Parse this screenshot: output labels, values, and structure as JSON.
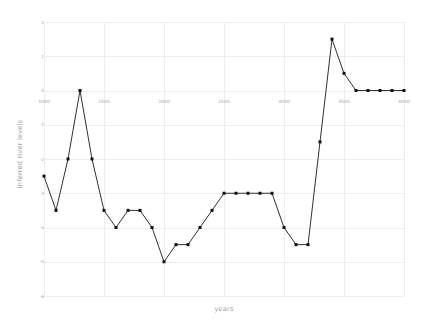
{
  "chart": {
    "title": "",
    "xlabel": "years",
    "ylabel": "inferred river levels",
    "background_color": "#ffffff",
    "line_color": "#1a1a1a",
    "marker_color": "#111111",
    "grid_color": "#eceef0",
    "tick_label_color": "#9aa0a6"
  },
  "axes": {
    "x_ticks": [
      "1000",
      "1500",
      "2000",
      "2500",
      "3000",
      "3500",
      "4000"
    ],
    "y_ticks": [
      "2",
      "1",
      "0",
      "-1",
      "-2",
      "-3",
      "-4",
      "-5",
      "-6"
    ],
    "xlim": [
      1000,
      4000
    ],
    "ylim": [
      -6,
      2
    ]
  },
  "chart_data": {
    "type": "line",
    "title": "",
    "xlabel": "years",
    "ylabel": "inferred river levels",
    "xlim": [
      1000,
      4000
    ],
    "ylim": [
      -6,
      2
    ],
    "grid": true,
    "legend": "none",
    "marker": "square",
    "x": [
      1000,
      1100,
      1200,
      1300,
      1400,
      1500,
      1600,
      1700,
      1800,
      1900,
      2000,
      2100,
      2200,
      2300,
      2400,
      2500,
      2600,
      2700,
      2800,
      2900,
      3000,
      3100,
      3200,
      3300,
      3400,
      3500,
      3600,
      3700,
      3800,
      3900,
      4000
    ],
    "values": [
      -2.5,
      -3.5,
      -2.0,
      0.0,
      -2.0,
      -3.5,
      -4.0,
      -3.5,
      -3.5,
      -4.0,
      -5.0,
      -4.5,
      -4.5,
      -4.0,
      -3.5,
      -3.0,
      -3.0,
      -3.0,
      -3.0,
      -3.0,
      -4.0,
      -4.5,
      -4.5,
      -1.5,
      1.5,
      0.5,
      0.0,
      0.0,
      0.0,
      0.0,
      0.0
    ],
    "series": [
      {
        "name": "inferred river levels",
        "values": [
          -2.5,
          -3.5,
          -2.0,
          0.0,
          -2.0,
          -3.5,
          -4.0,
          -3.5,
          -3.5,
          -4.0,
          -5.0,
          -4.5,
          -4.5,
          -4.0,
          -3.5,
          -3.0,
          -3.0,
          -3.0,
          -3.0,
          -3.0,
          -4.0,
          -4.5,
          -4.5,
          -1.5,
          1.5,
          0.5,
          0.0,
          0.0,
          0.0,
          0.0,
          0.0
        ]
      }
    ]
  }
}
